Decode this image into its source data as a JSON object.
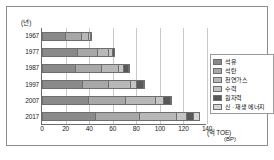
{
  "chart_data": {
    "type": "bar",
    "orientation": "horizontal",
    "stacked": true,
    "title": "",
    "xlabel": "(억 TOE)",
    "xlabel_source": "(BP)",
    "ylabel": "(년)",
    "categories": [
      "1967",
      "1977",
      "1987",
      "1997",
      "2007",
      "2017"
    ],
    "xticks": [
      "0",
      "20",
      "40",
      "60",
      "80",
      "100",
      "120",
      "140"
    ],
    "xtick_values": [
      0,
      20,
      40,
      60,
      80,
      100,
      120,
      140
    ],
    "xlim": [
      0,
      140
    ],
    "grid": true,
    "legend_position": "right",
    "series": [
      {
        "name": "석유",
        "color": "#8a8a8a",
        "values": [
          20.0,
          30.0,
          28.0,
          34.0,
          39.0,
          45.0
        ]
      },
      {
        "name": "석탄",
        "color": "#a8a8a8",
        "values": [
          14.5,
          17.0,
          23.0,
          22.5,
          31.5,
          37.5
        ]
      },
      {
        "name": "천연가스",
        "color": "#b8b8b8",
        "values": [
          5.5,
          10.0,
          14.5,
          19.0,
          26.0,
          31.5
        ]
      },
      {
        "name": "수력",
        "color": "#c4c4c4",
        "values": [
          2.0,
          3.5,
          4.8,
          5.8,
          6.8,
          9.0
        ]
      },
      {
        "name": "원자력",
        "color": "#595959",
        "values": [
          0.2,
          1.5,
          4.2,
          6.0,
          6.2,
          5.9
        ]
      },
      {
        "name": "신 · 재생 에너지",
        "color": "#d4d4d4",
        "values": [
          0.0,
          0.0,
          0.2,
          0.4,
          1.0,
          4.9
        ]
      }
    ],
    "totals": [
      42.2,
      62.0,
      74.7,
      87.7,
      110.5,
      133.8
    ]
  },
  "legend": {
    "items": [
      {
        "label": "석유"
      },
      {
        "label": "석탄"
      },
      {
        "label": "천연가스"
      },
      {
        "label": "수력"
      },
      {
        "label": "원자력"
      },
      {
        "label": "신 · 재생 에너지"
      }
    ]
  },
  "axes": {
    "y_unit": "(년)",
    "x_unit": "(억 TOE)",
    "source": "(BP)"
  }
}
